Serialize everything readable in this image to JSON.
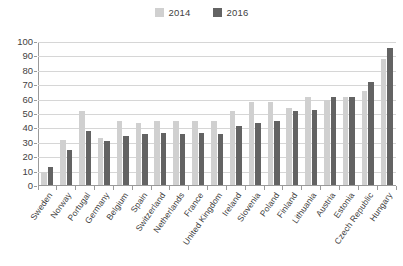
{
  "chart_data": {
    "type": "bar",
    "title": "",
    "subtitle": "",
    "xlabel": "",
    "ylabel": "",
    "ylim": [
      0,
      100
    ],
    "ytick_step": 10,
    "yticks": [
      100,
      90,
      80,
      70,
      60,
      50,
      40,
      30,
      20,
      10,
      0
    ],
    "grid": true,
    "legend_position": "top-center",
    "categories": [
      "Sweden",
      "Norway",
      "Portugal",
      "Germany",
      "Belgium",
      "Spain",
      "Switzerland",
      "Netherlands",
      "France",
      "United Kingdom",
      "Ireland",
      "Slovenia",
      "Poland",
      "Finland",
      "Lithuania",
      "Austria",
      "Estonia",
      "Czech Republic",
      "Hungary"
    ],
    "series": [
      {
        "name": "2014",
        "color": "#d0d0d0",
        "values": [
          10,
          32,
          52,
          33,
          45,
          44,
          45,
          45,
          45,
          45,
          52,
          58,
          58,
          54,
          62,
          60,
          62,
          66,
          88
        ]
      },
      {
        "name": "2016",
        "color": "#636363",
        "values": [
          13,
          25,
          38,
          31,
          35,
          36,
          37,
          36,
          37,
          36,
          42,
          44,
          45,
          52,
          53,
          62,
          62,
          72,
          96
        ]
      }
    ]
  },
  "legend": {
    "entries": [
      {
        "label": "2014",
        "color": "#d0d0d0"
      },
      {
        "label": "2016",
        "color": "#636363"
      }
    ]
  },
  "colors": {
    "series_2014": "#d0d0d0",
    "series_2016": "#636363",
    "gridline": "#d6d6d6",
    "axis": "#9a9a9a",
    "text": "#3f3f3f",
    "background": "#ffffff"
  }
}
